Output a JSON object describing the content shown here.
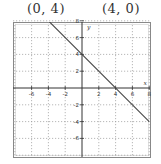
{
  "labels": {
    "point_a": "(0, 4)",
    "point_b": "(4, 0)"
  },
  "chart_data": {
    "type": "line",
    "title": "",
    "xlabel": "x",
    "ylabel": "y",
    "xlim": [
      -8,
      8
    ],
    "ylim": [
      -8,
      8
    ],
    "grid": true,
    "grid_step": 2,
    "x_ticks": [
      -6,
      -4,
      -2,
      2,
      4,
      6,
      8
    ],
    "y_ticks": [
      -6,
      -4,
      -2,
      2,
      4,
      6,
      8
    ],
    "series": [
      {
        "name": "line through (0,4) and (4,0)",
        "equation": "y = -x + 4",
        "x": [
          -4,
          8
        ],
        "y": [
          8,
          -4
        ]
      }
    ],
    "annotations": [
      "(0, 4)",
      "(4, 0)"
    ]
  },
  "colors": {
    "axis": "#333333",
    "grid": "#9a9a9a",
    "line": "#444444",
    "frame": "#888888"
  }
}
